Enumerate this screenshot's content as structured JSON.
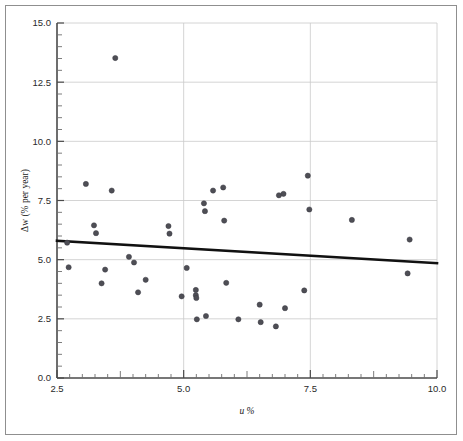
{
  "chart_data": {
    "type": "scatter",
    "title": "",
    "xlabel": "u %",
    "ylabel": "Δw (% per year)",
    "xlim": [
      2.5,
      10.0
    ],
    "ylim": [
      0.0,
      15.0
    ],
    "xticks": [
      2.5,
      5.0,
      7.5,
      10.0
    ],
    "xtick_labels": [
      "2.5",
      "5.0",
      "7.5",
      "10.0"
    ],
    "yticks": [
      0.0,
      2.5,
      5.0,
      7.5,
      10.0,
      12.5,
      15.0
    ],
    "ytick_labels": [
      "0.0",
      "2.5",
      "5.0",
      "7.5",
      "10.0",
      "12.5",
      "15.0"
    ],
    "x_minor_step": 0.25,
    "y_minor_step": 0.5,
    "grid": true,
    "grid_color": "#c9c9c9",
    "legend": null,
    "point_color": "#4e4e55",
    "trend_color": "#111111",
    "points": [
      {
        "x": 2.7,
        "y": 5.72
      },
      {
        "x": 2.73,
        "y": 4.68
      },
      {
        "x": 3.07,
        "y": 8.2
      },
      {
        "x": 3.23,
        "y": 6.45
      },
      {
        "x": 3.27,
        "y": 6.12
      },
      {
        "x": 3.38,
        "y": 4.0
      },
      {
        "x": 3.45,
        "y": 4.58
      },
      {
        "x": 3.58,
        "y": 7.92
      },
      {
        "x": 3.65,
        "y": 13.52
      },
      {
        "x": 3.92,
        "y": 5.12
      },
      {
        "x": 4.02,
        "y": 4.88
      },
      {
        "x": 4.1,
        "y": 3.62
      },
      {
        "x": 4.25,
        "y": 4.15
      },
      {
        "x": 4.7,
        "y": 6.42
      },
      {
        "x": 4.72,
        "y": 6.1
      },
      {
        "x": 4.96,
        "y": 3.45
      },
      {
        "x": 5.06,
        "y": 4.65
      },
      {
        "x": 5.24,
        "y": 3.72
      },
      {
        "x": 5.24,
        "y": 3.5
      },
      {
        "x": 5.25,
        "y": 3.38
      },
      {
        "x": 5.26,
        "y": 2.48
      },
      {
        "x": 5.4,
        "y": 7.38
      },
      {
        "x": 5.42,
        "y": 7.05
      },
      {
        "x": 5.44,
        "y": 2.62
      },
      {
        "x": 5.58,
        "y": 7.92
      },
      {
        "x": 5.78,
        "y": 8.05
      },
      {
        "x": 5.8,
        "y": 6.65
      },
      {
        "x": 5.84,
        "y": 4.02
      },
      {
        "x": 6.08,
        "y": 2.48
      },
      {
        "x": 6.5,
        "y": 3.1
      },
      {
        "x": 6.52,
        "y": 2.36
      },
      {
        "x": 6.82,
        "y": 2.18
      },
      {
        "x": 6.88,
        "y": 7.72
      },
      {
        "x": 6.97,
        "y": 7.78
      },
      {
        "x": 7.0,
        "y": 2.95
      },
      {
        "x": 7.38,
        "y": 3.7
      },
      {
        "x": 7.45,
        "y": 8.55
      },
      {
        "x": 7.48,
        "y": 7.12
      },
      {
        "x": 8.32,
        "y": 6.68
      },
      {
        "x": 9.46,
        "y": 5.85
      },
      {
        "x": 9.42,
        "y": 4.42
      }
    ],
    "trendline": {
      "x_start": 2.5,
      "y_start": 5.8,
      "x_end": 10.0,
      "y_end": 4.85,
      "label": ""
    }
  }
}
